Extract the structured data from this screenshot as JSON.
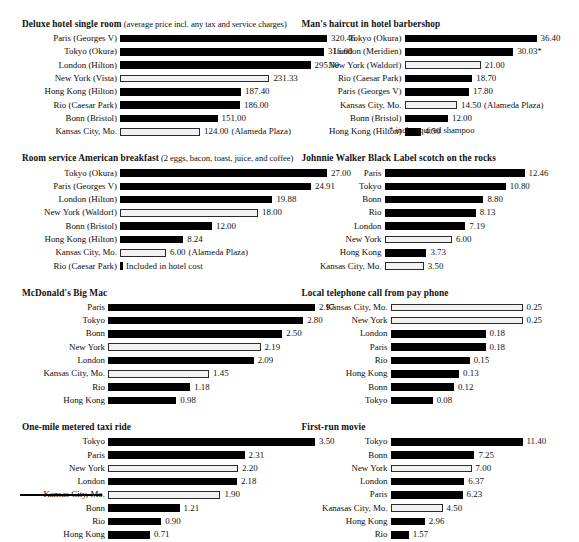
{
  "layout": {
    "bar_scale_left_px_per_unit": null,
    "left_column_bar_origin_px": 117,
    "right_column_bar_origin_px": 387
  },
  "footnotes": [
    {
      "id": "haircut-shampoo-note",
      "text": "* incl. required shampoo"
    }
  ],
  "panels": [
    {
      "id": "hotel-room",
      "column": "left",
      "title": "Deluxe hotel single room",
      "subtitle": "(average price incl. any tax and service charges)",
      "label_width": 95,
      "bar_max": 207,
      "chart_data": {
        "type": "bar",
        "title": "Deluxe hotel single room",
        "subtitle": "(average price incl. any tax and service charges)",
        "orientation": "horizontal",
        "xlabel": "",
        "ylabel": "",
        "categories": [
          "Paris (Georges V)",
          "Tokyo (Okura)",
          "London (Hilton)",
          "New York (Vista)",
          "Hong Kong (Hilton)",
          "Rio (Caesar Park)",
          "Bonn (Bristol)",
          "Kansas City, Mo."
        ],
        "values": [
          320.46,
          316.0,
          295.0,
          231.33,
          187.4,
          186.0,
          151.0,
          124.0
        ],
        "value_labels": [
          "320.46",
          "316.00",
          "295.00",
          "231.33",
          "187.40",
          "186.00",
          "151.00",
          "124.00"
        ],
        "highlight": [
          "New York (Vista)",
          "Kansas City, Mo."
        ],
        "notes": [
          "",
          "",
          "",
          "",
          "",
          "",
          "",
          "(Alameda Plaza)"
        ],
        "xlim": [
          0,
          320.46
        ]
      }
    },
    {
      "id": "breakfast",
      "column": "left",
      "title": "Room service American breakfast",
      "subtitle": "(2 eggs, bacon, toast, juice, and coffee)",
      "label_width": 95,
      "bar_max": 207,
      "chart_data": {
        "type": "bar",
        "title": "Room service American breakfast",
        "subtitle": "(2 eggs, bacon, toast, juice, and coffee)",
        "orientation": "horizontal",
        "categories": [
          "Tokyo (Okura)",
          "Paris (Georges V)",
          "London (Hilton)",
          "New York (Waldorf)",
          "Bonn (Bristol)",
          "Hong Kong (Hilton)",
          "Kansas City, Mo.",
          "Rio (Caesar Park)"
        ],
        "values": [
          27.0,
          24.91,
          19.88,
          18.0,
          12.0,
          8.24,
          6.0,
          0
        ],
        "value_labels": [
          "27.00",
          "24.91",
          "19.88",
          "18.00",
          "12.00",
          "8.24",
          "6.00",
          ""
        ],
        "highlight": [
          "New York (Waldorf)",
          "Kansas City, Mo."
        ],
        "notes": [
          "",
          "",
          "",
          "",
          "",
          "",
          "(Alameda Plaza)",
          "Included in hotel cost"
        ],
        "xlim": [
          0,
          27.0
        ]
      }
    },
    {
      "id": "big-mac",
      "column": "left",
      "title": "McDonald's Big Mac",
      "subtitle": "",
      "label_width": 83,
      "bar_max": 207,
      "chart_data": {
        "type": "bar",
        "title": "McDonald's Big Mac",
        "orientation": "horizontal",
        "categories": [
          "Paris",
          "Tokyo",
          "Bonn",
          "New York",
          "London",
          "Kansas City, Mo.",
          "Rio",
          "Hong Kong"
        ],
        "values": [
          2.97,
          2.8,
          2.5,
          2.19,
          2.09,
          1.45,
          1.18,
          0.98
        ],
        "value_labels": [
          "2.97",
          "2.80",
          "2.50",
          "2.19",
          "2.09",
          "1.45",
          "1.18",
          "0.98"
        ],
        "highlight": [
          "New York",
          "Kansas City, Mo."
        ],
        "notes": [
          "",
          "",
          "",
          "",
          "",
          "",
          "",
          ""
        ],
        "xlim": [
          0,
          2.97
        ]
      }
    },
    {
      "id": "taxi",
      "column": "left",
      "title": "One-mile metered taxi ride",
      "subtitle": "",
      "label_width": 83,
      "bar_max": 207,
      "chart_data": {
        "type": "bar",
        "title": "One-mile metered taxi ride",
        "orientation": "horizontal",
        "categories": [
          "Tokyo",
          "Paris",
          "New York",
          "London",
          "Kansas City, Mo.",
          "Bonn",
          "Rio",
          "Hong Kong"
        ],
        "values": [
          3.5,
          2.31,
          2.2,
          2.18,
          1.9,
          1.21,
          0.9,
          0.71
        ],
        "value_labels": [
          "3.50",
          "2.31",
          "2.20",
          "2.18",
          "1.90",
          "1.21",
          "0.90",
          "0.71"
        ],
        "highlight": [
          "New York",
          "Kansas City, Mo."
        ],
        "notes": [
          "",
          "",
          "",
          "",
          "",
          "",
          "",
          ""
        ],
        "xlim": [
          0,
          3.5
        ]
      }
    },
    {
      "id": "haircut",
      "column": "right",
      "title": "Man's haircut in hotel barbershop",
      "subtitle": "",
      "label_width": 100,
      "bar_max": 132,
      "chart_data": {
        "type": "bar",
        "title": "Man's haircut in hotel barbershop",
        "orientation": "horizontal",
        "categories": [
          "Tokyo (Okura)",
          "London (Meridien)",
          "New York (Waldorf)",
          "Rio (Caesar Park)",
          "Paris (Georges V)",
          "Kansas City, Mo.",
          "Bonn (Bristol)",
          "Hong Kong (Hilton)"
        ],
        "values": [
          36.4,
          30.03,
          21.0,
          18.7,
          17.8,
          14.5,
          12.0,
          4.5
        ],
        "value_labels": [
          "36.40",
          "30.03*",
          "21.00",
          "18.70",
          "17.80",
          "14.50",
          "12.00",
          "4.50"
        ],
        "highlight": [
          "New York (Waldorf)",
          "Kansas City, Mo."
        ],
        "notes": [
          "",
          "",
          "",
          "",
          "",
          "(Alameda Plaza)",
          "",
          ""
        ],
        "xlim": [
          0,
          36.4
        ]
      }
    },
    {
      "id": "scotch",
      "column": "right",
      "title": "Johnnie Walker Black Label scotch on the rocks",
      "subtitle": "",
      "label_width": 80,
      "bar_max": 140,
      "chart_data": {
        "type": "bar",
        "title": "Johnnie Walker Black Label scotch on the rocks",
        "orientation": "horizontal",
        "categories": [
          "Paris",
          "Tokyo",
          "Bonn",
          "Rio",
          "London",
          "New York",
          "Hong Kong",
          "Kansas City, Mo."
        ],
        "values": [
          12.46,
          10.8,
          8.8,
          8.13,
          7.19,
          6.0,
          3.73,
          3.5
        ],
        "value_labels": [
          "12.46",
          "10.80",
          "8.80",
          "8.13",
          "7.19",
          "6.00",
          "3.73",
          "3.50"
        ],
        "highlight": [
          "New York",
          "Kansas City, Mo."
        ],
        "notes": [
          "",
          "",
          "",
          "",
          "",
          "",
          "",
          ""
        ],
        "xlim": [
          0,
          12.46
        ]
      }
    },
    {
      "id": "phone",
      "column": "right",
      "title": "Local telephone call from pay phone",
      "subtitle": "",
      "label_width": 86,
      "bar_max": 132,
      "chart_data": {
        "type": "bar",
        "title": "Local telephone call from pay phone",
        "orientation": "horizontal",
        "categories": [
          "Kansas City, Mo.",
          "New York",
          "London",
          "Paris",
          "Rio",
          "Hong Kong",
          "Bonn",
          "Tokyo"
        ],
        "values": [
          0.25,
          0.25,
          0.18,
          0.18,
          0.15,
          0.13,
          0.12,
          0.08
        ],
        "value_labels": [
          "0.25",
          "0.25",
          "0.18",
          "0.18",
          "0.15",
          "0.13",
          "0.12",
          "0.08"
        ],
        "highlight": [
          "Kansas City, Mo.",
          "New York"
        ],
        "notes": [
          "",
          "",
          "",
          "",
          "",
          "",
          "",
          ""
        ],
        "xlim": [
          0,
          0.25
        ]
      }
    },
    {
      "id": "movie",
      "column": "right",
      "title": "First-run movie",
      "subtitle": "",
      "label_width": 86,
      "bar_max": 132,
      "chart_data": {
        "type": "bar",
        "title": "First-run movie",
        "orientation": "horizontal",
        "categories": [
          "Tokyo",
          "Bonn",
          "New York",
          "London",
          "Paris",
          "Kanasas City, Mo.",
          "Hong Kong",
          "Rio"
        ],
        "values": [
          11.4,
          7.25,
          7.0,
          6.37,
          6.23,
          4.5,
          2.96,
          1.57
        ],
        "value_labels": [
          "11.40",
          "7.25",
          "7.00",
          "6.37",
          "6.23",
          "4.50",
          "2.96",
          "1.57"
        ],
        "highlight": [
          "New York",
          "Kanasas City, Mo."
        ],
        "notes": [
          "",
          "",
          "",
          "",
          "",
          "",
          "",
          ""
        ],
        "xlim": [
          0,
          11.4
        ]
      }
    }
  ]
}
